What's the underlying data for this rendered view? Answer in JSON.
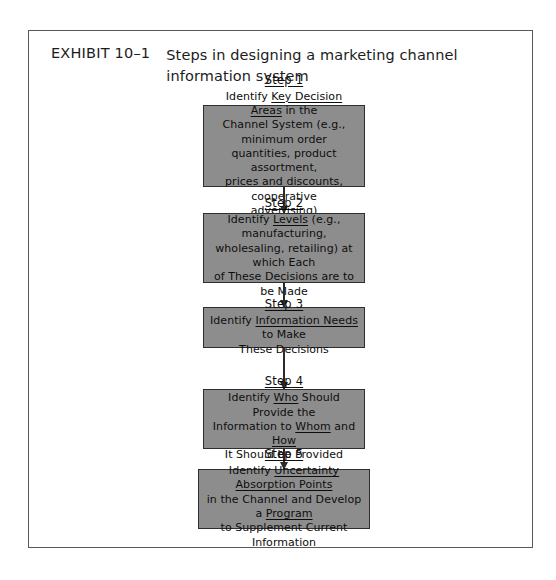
{
  "exhibit": {
    "label": "EXHIBIT 10–1",
    "title": "Steps in designing a marketing channel information system"
  },
  "colors": {
    "box_fill": "#8d8d8d",
    "box_border": "#2e2e2e",
    "frame_border": "#585858",
    "arrow": "#2b2b2b",
    "page_background": "#ffffff",
    "text": "#0d0d0d"
  },
  "diagram": {
    "type": "flowchart",
    "orientation": "vertical-top-to-bottom",
    "connector": "downward-arrow",
    "steps": [
      {
        "id": "step-1",
        "title": "Step 1",
        "body": "Identify Key Decision Areas in the Channel System (e.g., minimum order quantities, product assortment, prices and discounts, cooperative advertising)",
        "emphasis": [
          "Key Decision Areas"
        ]
      },
      {
        "id": "step-2",
        "title": "Step 2",
        "body": "Identify Levels (e.g., manufacturing, wholesaling, retailing) at which Each of These Decisions are to be Made",
        "emphasis": [
          "Levels"
        ]
      },
      {
        "id": "step-3",
        "title": "Step 3",
        "body": "Identify Information Needs to Make These Decisions",
        "emphasis": [
          "Information Needs"
        ]
      },
      {
        "id": "step-4",
        "title": "Step 4",
        "body": "Identify Who Should Provide the Information to Whom and How It Should be Provided",
        "emphasis": [
          "Who",
          "Whom",
          "How"
        ]
      },
      {
        "id": "step-5",
        "title": "Step 5",
        "body": "Identify Uncertainty Absorption Points in the Channel and Develop a Program to Supplement Current Information",
        "emphasis": [
          "Uncertainty Absorption Points",
          "Program"
        ]
      }
    ],
    "arrows": [
      {
        "id": "arrow-1-2",
        "from": "step-1",
        "to": "step-2"
      },
      {
        "id": "arrow-2-3",
        "from": "step-2",
        "to": "step-3"
      },
      {
        "id": "arrow-3-4",
        "from": "step-3",
        "to": "step-4"
      },
      {
        "id": "arrow-4-5",
        "from": "step-4",
        "to": "step-5"
      }
    ]
  }
}
